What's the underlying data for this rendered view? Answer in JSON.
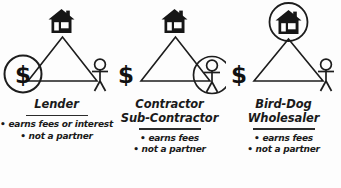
{
  "diagram": {
    "background_color": "#fdfdfd",
    "ink_color": "#1a1a1a",
    "panels": [
      {
        "id": "lender",
        "role_title_lines": [
          "Lender"
        ],
        "bullets": [
          "• earns fees or interest",
          "• not a partner"
        ],
        "highlighted_node": "money",
        "nodes": {
          "house": "house-icon",
          "money": "dollar-sign",
          "person": "stick-figure-person"
        }
      },
      {
        "id": "contractor",
        "role_title_lines": [
          "Contractor",
          "Sub-Contractor"
        ],
        "bullets": [
          "• earns fees",
          "• not a partner"
        ],
        "highlighted_node": "person",
        "nodes": {
          "house": "house-icon",
          "money": "dollar-sign",
          "person": "stick-figure-person"
        }
      },
      {
        "id": "bird-dog",
        "role_title_lines": [
          "Bird-Dog",
          "Wholesaler"
        ],
        "bullets": [
          "• earns fees",
          "• not a partner"
        ],
        "highlighted_node": "house",
        "nodes": {
          "house": "house-icon",
          "money": "dollar-sign",
          "person": "stick-figure-person"
        }
      }
    ],
    "symbols": {
      "dollar_glyph": "$"
    }
  }
}
